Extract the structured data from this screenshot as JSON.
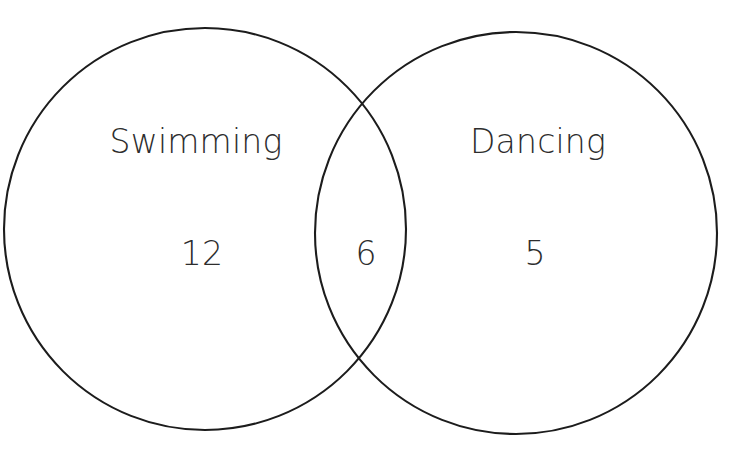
{
  "figure": {
    "name": "two-set-venn-diagram",
    "background_color": "#ffffff",
    "stroke_color": "#1c1c1c",
    "text_color": "#2d2d2d",
    "title_partial": ""
  },
  "sets": {
    "left": {
      "label": "Swimming",
      "only_count": "12",
      "center_x": 205,
      "center_y": 229,
      "radius": 201
    },
    "right": {
      "label": "Dancing",
      "only_count": "5",
      "center_x": 516,
      "center_y": 233,
      "radius": 201
    }
  },
  "intersection": {
    "label": "",
    "count": "6"
  },
  "label_positions": {
    "left_label_x": 196,
    "left_label_y": 153,
    "right_label_x": 538,
    "right_label_y": 153,
    "left_count_x": 202,
    "left_count_y": 265,
    "intersection_count_x": 366,
    "intersection_count_y": 265,
    "right_count_x": 535,
    "right_count_y": 265
  },
  "chart_data": {
    "type": "venn",
    "title": "",
    "categories": [
      "Swimming",
      "Dancing"
    ],
    "regions": [
      {
        "region": "Swimming only",
        "sets": [
          "Swimming"
        ],
        "value": 12
      },
      {
        "region": "Swimming and Dancing",
        "sets": [
          "Swimming",
          "Dancing"
        ],
        "value": 6
      },
      {
        "region": "Dancing only",
        "sets": [
          "Dancing"
        ],
        "value": 5
      }
    ],
    "set_totals": [
      {
        "name": "Swimming",
        "value": 18
      },
      {
        "name": "Dancing",
        "value": 11
      }
    ],
    "total": 23,
    "grid": false,
    "legend": "none"
  }
}
